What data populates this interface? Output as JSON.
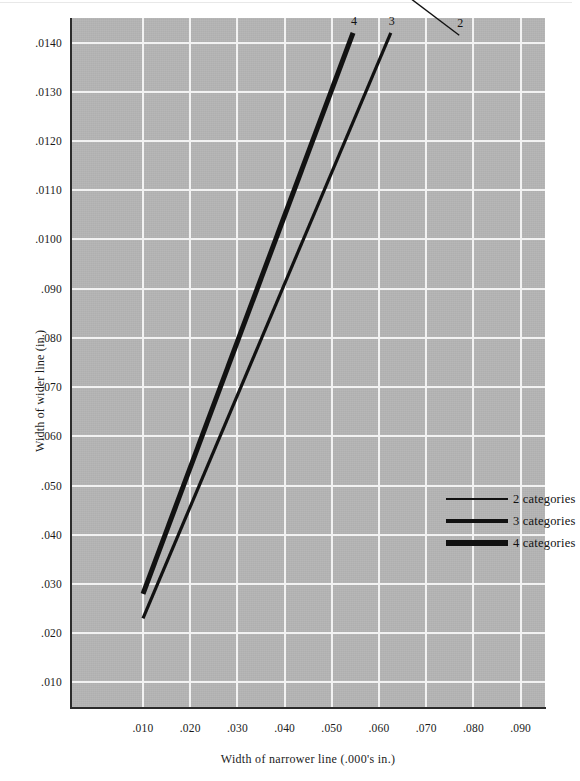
{
  "chart_data": {
    "type": "line",
    "title": "",
    "subtitle": "",
    "xlabel": "Width of narrower line (.000's in.)",
    "ylabel": "Width of wider line (in.)",
    "xlim": [
      0.005,
      0.0995
    ],
    "ylim": [
      0.005,
      0.0145
    ],
    "grid": true,
    "legend_position": "center-right",
    "xticks": [
      0.01,
      0.02,
      0.03,
      0.04,
      0.05,
      0.06,
      0.07,
      0.08,
      0.09
    ],
    "xtick_labels": [
      ".010",
      ".020",
      ".030",
      ".040",
      ".050",
      ".060",
      ".070",
      ".080",
      ".090"
    ],
    "yticks": [
      0.01,
      0.02,
      0.03,
      0.04,
      0.05,
      0.06,
      0.07,
      0.08,
      0.09,
      0.01,
      0.011,
      0.012,
      0.013,
      0.014
    ],
    "ytick_labels": [
      ".010",
      ".020",
      ".030",
      ".040",
      ".050",
      ".060",
      ".070",
      ".080",
      ".090",
      ".0100",
      ".0110",
      ".0120",
      ".0130",
      ".0140"
    ],
    "series": [
      {
        "name": "2 categories",
        "endpoint_label": "2",
        "line_width_px": 1.4,
        "color": "#111111",
        "x": [
          0.01,
          0.077
        ],
        "y": [
          0.019,
          0.1415
        ]
      },
      {
        "name": "3 categories",
        "endpoint_label": "3",
        "line_width_px": 3.2,
        "color": "#111111",
        "x": [
          0.01,
          0.0625
        ],
        "y": [
          0.023,
          0.142
        ]
      },
      {
        "name": "4 categories",
        "endpoint_label": "4",
        "line_width_px": 5.0,
        "color": "#111111",
        "x": [
          0.01,
          0.0545
        ],
        "y": [
          0.028,
          0.142
        ]
      }
    ]
  },
  "axes": {
    "y": {
      "label": "Width of wider line (in.)",
      "ticks": [
        {
          "label": ".0140",
          "value": 0.014
        },
        {
          "label": ".0130",
          "value": 0.013
        },
        {
          "label": ".0120",
          "value": 0.012
        },
        {
          "label": ".0110",
          "value": 0.011
        },
        {
          "label": ".0100",
          "value": 0.01
        },
        {
          "label": ".090",
          "value": 0.009
        },
        {
          "label": ".080",
          "value": 0.008
        },
        {
          "label": ".070",
          "value": 0.007
        },
        {
          "label": ".060",
          "value": 0.006
        },
        {
          "label": ".050",
          "value": 0.005
        },
        {
          "label": ".040",
          "value": 0.004
        },
        {
          "label": ".030",
          "value": 0.003
        },
        {
          "label": ".020",
          "value": 0.002
        },
        {
          "label": ".010",
          "value": 0.001
        }
      ]
    },
    "x": {
      "label": "Width of narrower line (.000's in.)",
      "ticks": [
        {
          "label": ".010",
          "value": 0.01
        },
        {
          "label": ".020",
          "value": 0.02
        },
        {
          "label": ".030",
          "value": 0.03
        },
        {
          "label": ".040",
          "value": 0.04
        },
        {
          "label": ".050",
          "value": 0.05
        },
        {
          "label": ".060",
          "value": 0.06
        },
        {
          "label": ".070",
          "value": 0.07
        },
        {
          "label": ".080",
          "value": 0.08
        },
        {
          "label": ".090",
          "value": 0.09
        }
      ]
    }
  },
  "legend": {
    "entries": [
      {
        "label": "2 categories",
        "thickness": 1.6
      },
      {
        "label": "3 categories",
        "thickness": 3.4
      },
      {
        "label": "4 categories",
        "thickness": 5.2
      }
    ]
  },
  "endpoint_labels": [
    {
      "text": "4"
    },
    {
      "text": "3"
    },
    {
      "text": "2"
    }
  ],
  "colors": {
    "plot_background": "#b4b4b4",
    "gridline": "#f2f2f2",
    "axis": "#2b2b2b",
    "series": "#111111",
    "page_background": "#ffffff"
  }
}
